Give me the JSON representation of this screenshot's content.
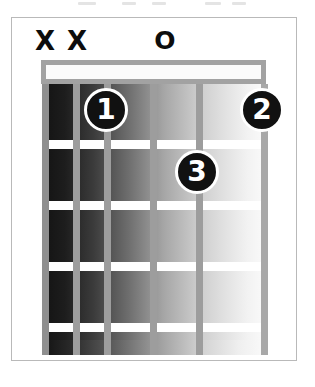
{
  "diagram": {
    "frets": 4,
    "strings": 6,
    "string_markers": [
      {
        "string": 1,
        "symbol": "X",
        "meaning": "muted",
        "x": 45
      },
      {
        "string": 2,
        "symbol": "X",
        "meaning": "muted",
        "x": 77
      },
      {
        "string": 3,
        "symbol": "",
        "meaning": "none",
        "x": 115
      },
      {
        "string": 4,
        "symbol": "O",
        "meaning": "open",
        "x": 160
      },
      {
        "string": 5,
        "symbol": "",
        "meaning": "none",
        "x": 205
      },
      {
        "string": 6,
        "symbol": "",
        "meaning": "none",
        "x": 251
      }
    ],
    "fingerings": [
      {
        "label": "1",
        "string": 3,
        "fret": 1,
        "x": 106,
        "y": 88
      },
      {
        "label": "2",
        "string": 6,
        "fret": 1,
        "x": 240,
        "y": 88
      },
      {
        "label": "3",
        "string": 5,
        "fret": 2,
        "x": 196,
        "y": 150
      }
    ],
    "fret_lines_y": [
      140,
      201,
      262,
      323
    ],
    "string_lines_x": [
      42,
      73,
      104,
      150,
      196,
      261
    ],
    "colors": {
      "frame_border": "#b9b9b9",
      "nut_border": "#a2a2a2",
      "nut_fill": "#fbfbfb",
      "fret_wire": "#ffffff",
      "string": "#9d9d9d",
      "finger_dot": "#111111",
      "finger_text": "#ffffff",
      "marker_text": "#0d0d0d",
      "background": "#ffffff"
    }
  }
}
